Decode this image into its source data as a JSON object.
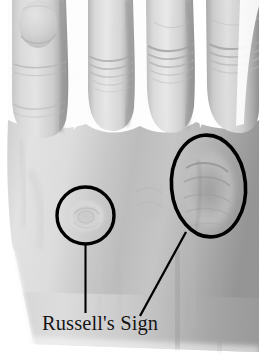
{
  "figure": {
    "title": "Russell's Sign",
    "colors": {
      "background": "#ffffff",
      "annotation_stroke": "#000000",
      "label_text": "#141414",
      "skin_light": "#e2e2e2",
      "skin_mid": "#c4c4c4",
      "skin_shadow": "#8f8f8f",
      "skin_deep_shadow": "#6e6e6e"
    }
  },
  "annotations": {
    "label": "Russell's Sign",
    "markers": [
      {
        "name": "ring-finger-knuckle-callus",
        "shape": "circle",
        "cx": 85.5,
        "cy": 215.5,
        "rx": 28.5,
        "ry": 28.5,
        "rotation": 0,
        "stroke_width": 3.4
      },
      {
        "name": "index-finger-knuckle-callus",
        "shape": "ellipse",
        "cx": 208.5,
        "cy": 186.0,
        "rx": 37.0,
        "ry": 51.0,
        "rotation": -5,
        "stroke_width": 3.6
      }
    ],
    "leader_lines": [
      {
        "name": "leader-line-left-vertical",
        "x1": 85.5,
        "y1": 244.5,
        "x2": 85.5,
        "y2": 313.0,
        "stroke_width": 2.1
      },
      {
        "name": "leader-line-right-diagonal",
        "x1": 186.0,
        "y1": 232.0,
        "x2": 140.0,
        "y2": 316.0,
        "stroke_width": 2.3
      }
    ]
  },
  "hand": {
    "fingers": [
      {
        "name": "little-finger",
        "label": "pinky"
      },
      {
        "name": "ring-finger",
        "label": "ring"
      },
      {
        "name": "middle-finger",
        "label": "middle"
      },
      {
        "name": "index-finger",
        "label": "index"
      }
    ],
    "region": "dorsum-metacarpophalangeal-joints"
  }
}
